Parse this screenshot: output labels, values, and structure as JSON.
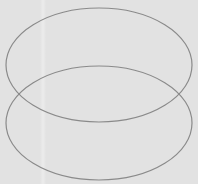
{
  "diagram": {
    "type": "overlapping-ellipses",
    "background_color": "#e2e2e2",
    "stroke_color": "#8a8a8a",
    "stroke_width": 1.2,
    "shapes": [
      {
        "name": "top-ellipse",
        "cx": 99,
        "cy": 65,
        "rx": 93,
        "ry": 57
      },
      {
        "name": "bottom-ellipse",
        "cx": 99,
        "cy": 123,
        "rx": 93,
        "ry": 57
      }
    ]
  }
}
